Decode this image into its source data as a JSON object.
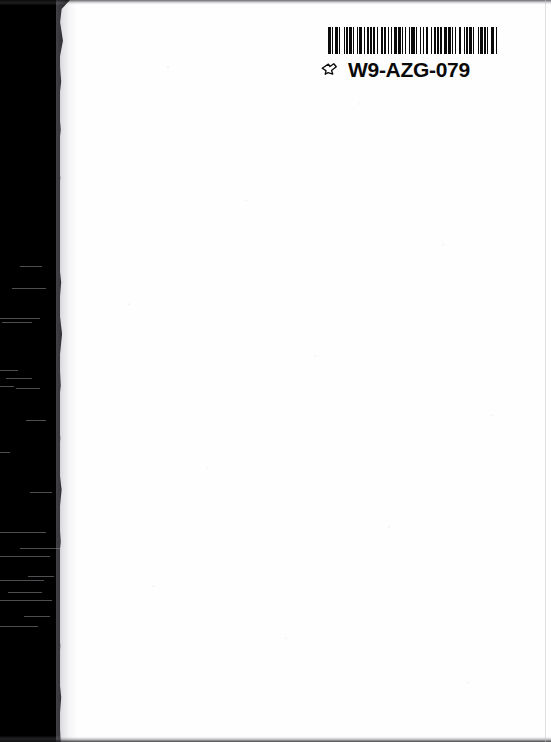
{
  "page": {
    "kind": "scanned-book-page",
    "background_color": "#fefeff",
    "orientation": "portrait"
  },
  "scan_artifacts": {
    "left_band_label": "scanner-edge-black-band",
    "left_band_color": "#000000",
    "top_edge_label": "scanner-edge-top",
    "bottom_edge_label": "scanner-edge-bottom",
    "page_shadow_label": "page-edge-shadow",
    "streaks": [
      {
        "top": 266,
        "left": 20,
        "width": 22
      },
      {
        "top": 288,
        "left": 12,
        "width": 34
      },
      {
        "top": 318,
        "left": 0,
        "width": 40
      },
      {
        "top": 322,
        "left": 2,
        "width": 30
      },
      {
        "top": 370,
        "left": 0,
        "width": 18
      },
      {
        "top": 378,
        "left": 6,
        "width": 26
      },
      {
        "top": 386,
        "left": 0,
        "width": 14
      },
      {
        "top": 388,
        "left": 16,
        "width": 24
      },
      {
        "top": 420,
        "left": 26,
        "width": 20
      },
      {
        "top": 452,
        "left": 0,
        "width": 10
      },
      {
        "top": 492,
        "left": 30,
        "width": 22
      },
      {
        "top": 532,
        "left": 0,
        "width": 46
      },
      {
        "top": 548,
        "left": 20,
        "width": 40
      },
      {
        "top": 556,
        "left": 0,
        "width": 50
      },
      {
        "top": 576,
        "left": 28,
        "width": 26
      },
      {
        "top": 580,
        "left": 0,
        "width": 44
      },
      {
        "top": 592,
        "left": 8,
        "width": 34
      },
      {
        "top": 600,
        "left": 0,
        "width": 52
      },
      {
        "top": 616,
        "left": 24,
        "width": 26
      },
      {
        "top": 626,
        "left": 0,
        "width": 38
      }
    ]
  },
  "barcode_label": {
    "code": "W9-AZG-079",
    "marker_icon": "pointing-hand-icon",
    "bar_color": "#0a0a0a",
    "label_background": "#ffffff",
    "bar_pattern": [
      3,
      2,
      1,
      2,
      3,
      1,
      2,
      4,
      1,
      2,
      2,
      1,
      3,
      1,
      2,
      3,
      1,
      1,
      4,
      2,
      1,
      2,
      3,
      1,
      2,
      1,
      3,
      2,
      1,
      4,
      2,
      1,
      2,
      3,
      1,
      2,
      1,
      2,
      4,
      1,
      3,
      1,
      2,
      2,
      1,
      3,
      2,
      1,
      4,
      1,
      2,
      3,
      1,
      2,
      1,
      3,
      2,
      4,
      1,
      2,
      2,
      1,
      3,
      1,
      2,
      2,
      4,
      1,
      3,
      2,
      1,
      2,
      1,
      4,
      2,
      3,
      1,
      2,
      2,
      1,
      3,
      2,
      1,
      4,
      1,
      2,
      3,
      1,
      2,
      2,
      1,
      3,
      4,
      2,
      1,
      3
    ]
  }
}
